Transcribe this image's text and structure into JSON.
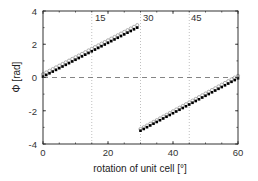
{
  "chart_data": {
    "type": "scatter",
    "title": "",
    "xlabel": "rotation of unit cell [°]",
    "ylabel": "Φ  [rad]",
    "xlim": [
      0,
      60
    ],
    "ylim": [
      -4,
      4
    ],
    "xticks": [
      0,
      20,
      40,
      60
    ],
    "yticks": [
      -4,
      -2,
      0,
      2,
      4
    ],
    "xtick_labels": [
      "0",
      "20",
      "40",
      "60"
    ],
    "ytick_labels": [
      "-4",
      "-2",
      "0",
      "2",
      "4"
    ],
    "grid": false,
    "legend": null,
    "reference_lines": {
      "horizontal_dashed": [
        0
      ],
      "vertical_dotted": [
        15,
        30,
        45
      ],
      "vertical_labels": [
        "15",
        "30",
        "45"
      ]
    },
    "series": [
      {
        "name": "open-circles",
        "marker": "circle-open",
        "color": "#999999",
        "segments": [
          {
            "x_start": 0,
            "x_end": 29,
            "y_start": 0.2,
            "y_end": 3.15
          },
          {
            "x_start": 30,
            "x_end": 60,
            "y_start": -3.1,
            "y_end": 0.1
          }
        ]
      },
      {
        "name": "filled-squares",
        "marker": "square-filled",
        "color": "#000000",
        "segments": [
          {
            "x_start": 0,
            "x_end": 29,
            "y_start": 0.05,
            "y_end": 3.0
          },
          {
            "x_start": 30,
            "x_end": 60,
            "y_start": -3.2,
            "y_end": -0.05
          }
        ]
      }
    ],
    "point_step": 1
  },
  "labels": {
    "xlabel": "rotation of unit cell [°]",
    "ylabel": "Φ  [rad]",
    "v15": "15",
    "v30": "30",
    "v45": "45",
    "x0": "0",
    "x20": "20",
    "x40": "40",
    "x60": "60",
    "ym4": "-4",
    "ym2": "-2",
    "y0": "0",
    "y2": "2",
    "y4": "4"
  }
}
